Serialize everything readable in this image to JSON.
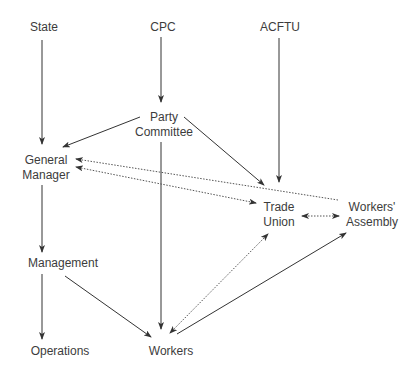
{
  "diagram": {
    "nodes": {
      "state": "State",
      "cpc": "CPC",
      "acftu": "ACFTU",
      "party_committee_l1": "Party",
      "party_committee_l2": "Committee",
      "general_manager_l1": "General",
      "general_manager_l2": "Manager",
      "trade_union_l1": "Trade",
      "trade_union_l2": "Union",
      "workers_assembly_l1": "Workers'",
      "workers_assembly_l2": "Assembly",
      "management": "Management",
      "operations": "Operations",
      "workers": "Workers"
    },
    "edges": [
      {
        "from": "State",
        "to": "General Manager",
        "style": "solid"
      },
      {
        "from": "CPC",
        "to": "Party Committee",
        "style": "solid"
      },
      {
        "from": "ACFTU",
        "to": "Trade Union",
        "style": "solid"
      },
      {
        "from": "Party Committee",
        "to": "General Manager",
        "style": "solid"
      },
      {
        "from": "Party Committee",
        "to": "Trade Union",
        "style": "solid"
      },
      {
        "from": "Party Committee",
        "to": "Workers",
        "style": "solid"
      },
      {
        "from": "Trade Union",
        "to": "General Manager",
        "style": "dotted"
      },
      {
        "from": "Workers' Assembly",
        "to": "General Manager",
        "style": "dotted"
      },
      {
        "from": "Trade Union",
        "to": "Workers' Assembly",
        "style": "dotted",
        "bidirectional": true
      },
      {
        "from": "General Manager",
        "to": "Management",
        "style": "solid"
      },
      {
        "from": "Management",
        "to": "Operations",
        "style": "solid"
      },
      {
        "from": "Management",
        "to": "Workers",
        "style": "solid"
      },
      {
        "from": "Workers",
        "to": "Trade Union",
        "style": "dotted",
        "bidirectional": true
      },
      {
        "from": "Workers",
        "to": "Workers' Assembly",
        "style": "solid"
      }
    ],
    "line_color": "#333333"
  }
}
